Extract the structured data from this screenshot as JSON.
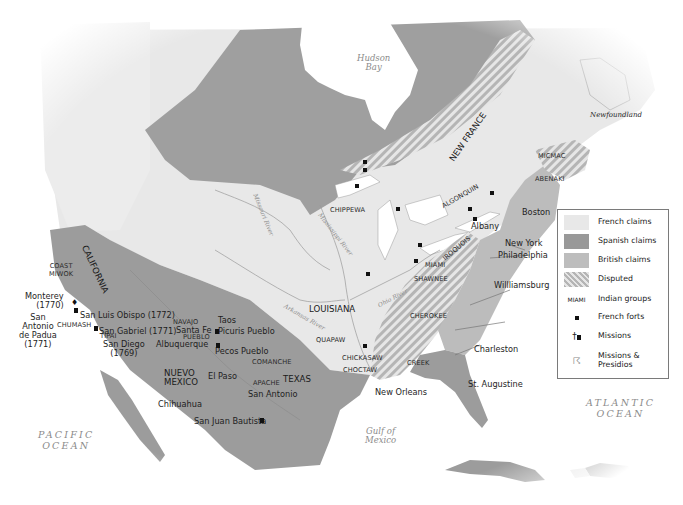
{
  "map": {
    "colors": {
      "french": "#e8e8e8",
      "spanish": "#999999",
      "british": "#bdbdbd",
      "disputed_stripe_a": "#e6e6e6",
      "disputed_stripe_b": "#b3b3b3",
      "water": "#ffffff"
    },
    "water_labels": {
      "hudson_bay": [
        "Hudson",
        "Bay"
      ],
      "gulf_of_mexico": [
        "Gulf of",
        "Mexico"
      ],
      "pacific": [
        "PACIFIC",
        "OCEAN"
      ],
      "atlantic": [
        "ATLANTIC",
        "OCEAN"
      ]
    },
    "landmass_labels": {
      "newfoundland": "Newfoundland"
    },
    "regions": {
      "new_france": "NEW FRANCE",
      "louisiana": "LOUISIANA",
      "california": "CALIFORNIA",
      "nuevo_mexico": [
        "NUEVO",
        "MEXICO"
      ],
      "texas": "TEXAS"
    },
    "rivers": {
      "missouri": "Missouri River",
      "mississippi": "Mississippi River",
      "arkansas": "Arkansas River",
      "ohio": "Ohio River"
    },
    "indian_groups": {
      "micmac": "MICMAC",
      "abenaki": "ABENAKI",
      "algonquin": "ALGONQUIN",
      "iroquois": "IROQUOIS",
      "chippewa": "CHIPPEWA",
      "miami": "MIAMI",
      "shawnee": "SHAWNEE",
      "cherokee": "CHEROKEE",
      "creek": "CREEK",
      "chickasaw": "CHICKASAW",
      "choctaw": "CHOCTAW",
      "quapaw": "QUAPAW",
      "comanche": "COMANCHE",
      "apache": "APACHE",
      "navajo": "NAVAJO",
      "pueblo": "PUEBLO",
      "coast_miwok": [
        "COAST",
        "MIWOK"
      ],
      "chumash": "CHUMASH",
      "tipai": "TIPAI"
    },
    "cities": {
      "boston": "Boston",
      "albany": "Albany",
      "new_york": "New York",
      "philadelphia": "Philadelphia",
      "williamsburg": "Willliamsburg",
      "charleston": "Charleston",
      "st_augustine": "St. Augustine",
      "new_orleans": "New Orleans",
      "san_antonio": "San Antonio",
      "san_juan_bautista": "San Juan Bautista",
      "el_paso": "El Paso",
      "chihuahua": "Chihuahua",
      "albuquerque": "Albuquerque",
      "santa_fe": "Santa Fe",
      "taos": "Taos",
      "picuris_pueblo": "Picuris Pueblo",
      "pecos_pueblo": "Pecos Pueblo",
      "monterey": [
        "Monterey",
        "(1770)"
      ],
      "san_antonio_de_padua": [
        "San",
        "Antonio",
        "de Padua",
        "(1771)"
      ],
      "san_luis_obispo": "San Luis Obispo (1772)",
      "san_gabriel": "San Gabriel (1771)",
      "san_diego": [
        "San Diego",
        "(1769)"
      ]
    },
    "legend": {
      "items": [
        {
          "type": "swatch",
          "key": "french",
          "label": "French claims"
        },
        {
          "type": "swatch",
          "key": "spanish",
          "label": "Spanish claims"
        },
        {
          "type": "swatch",
          "key": "british",
          "label": "British claims"
        },
        {
          "type": "swatch",
          "key": "disputed",
          "label": "Disputed"
        },
        {
          "type": "text",
          "symbol": "MIAMI",
          "label": "Indian groups"
        },
        {
          "type": "fort",
          "label": "French forts"
        },
        {
          "type": "mission",
          "label": "Missions"
        },
        {
          "type": "presidio",
          "label": "Missions & Presidios"
        }
      ],
      "symbol_miami": "MIAMI",
      "labels": [
        "French claims",
        "Spanish claims",
        "British claims",
        "Disputed",
        "Indian groups",
        "French forts",
        "Missions",
        "Missions &",
        "Presidios"
      ]
    }
  }
}
